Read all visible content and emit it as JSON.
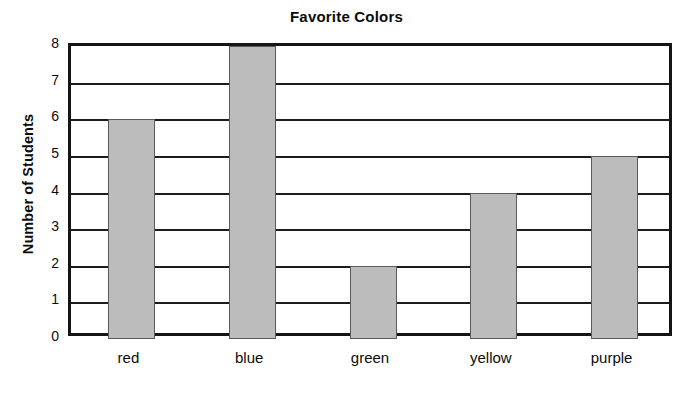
{
  "chart_data": {
    "type": "bar",
    "title": "Favorite Colors",
    "xlabel": "",
    "ylabel": "Number of Students",
    "categories": [
      "red",
      "blue",
      "green",
      "yellow",
      "purple"
    ],
    "values": [
      6,
      8,
      2,
      4,
      5
    ],
    "ylim": [
      0,
      8
    ],
    "ytick_labels": [
      "8",
      "7",
      "6",
      "5",
      "4",
      "3",
      "2",
      "1",
      "0"
    ],
    "ytick_values": [
      8,
      7,
      6,
      5,
      4,
      3,
      2,
      1,
      0
    ],
    "grid": true,
    "grid_axis": "y",
    "legend": false,
    "colors": {
      "bar_fill": "#bcbcbc",
      "bar_edge": "#5a5a5a",
      "axis": "#151515",
      "gridline": "#1c1c1c",
      "text": "#0b0b0b",
      "background": "#ffffff"
    }
  }
}
